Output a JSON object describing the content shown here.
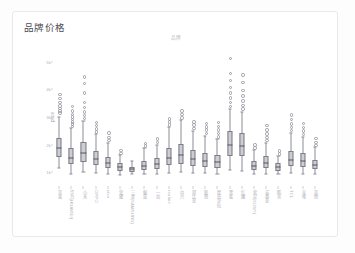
{
  "panel": {
    "title": "品牌价格"
  },
  "chart_data": {
    "type": "box",
    "title": "品牌",
    "xlabel": "",
    "ylabel": "price",
    "ylim": [
      500,
      5500
    ],
    "grid": false,
    "legend": null,
    "ytick_values": [
      5000,
      4000,
      3000,
      2000,
      1000
    ],
    "ytick_labels": [
      "5k",
      "4k",
      "3k",
      "2k",
      "1k"
    ],
    "categories": [
      "苹果",
      "华为(HUAWEI)",
      "小米",
      "OPPO",
      "vivo",
      "荣耀",
      "三星(SAMSUNG)",
      "魅族",
      "一加",
      "realme",
      "中兴",
      "努比亚",
      "联想",
      "摩托罗拉",
      "黑鲨",
      "红魔",
      "索尼(SONY)",
      "诺基亚",
      "酷派",
      "TCL",
      "朵唯",
      "其他"
    ],
    "boxes": [
      {
        "category": "苹果",
        "q1": 1550,
        "median": 1880,
        "q3": 2250,
        "whisker_low": 1150,
        "whisker_high": 3000,
        "fliers": [
          3180,
          3260,
          3340,
          3430,
          3560,
          3700,
          3860
        ]
      },
      {
        "category": "华为(HUAWEI)",
        "q1": 1280,
        "median": 1520,
        "q3": 1880,
        "whisker_low": 950,
        "whisker_high": 2600,
        "fliers": [
          2700,
          2780,
          2860,
          2940,
          3030,
          3120,
          3260,
          3420
        ]
      },
      {
        "category": "小米",
        "q1": 1380,
        "median": 1700,
        "q3": 2100,
        "whisker_low": 1000,
        "whisker_high": 2850,
        "fliers": [
          2980,
          3090,
          3210,
          3380,
          3560,
          3900,
          4250,
          4480
        ]
      },
      {
        "category": "OPPO",
        "q1": 1250,
        "median": 1480,
        "q3": 1760,
        "whisker_low": 980,
        "whisker_high": 2380,
        "fliers": [
          2500,
          2610,
          2720,
          2840
        ]
      },
      {
        "category": "vivo",
        "q1": 1150,
        "median": 1330,
        "q3": 1560,
        "whisker_low": 930,
        "whisker_high": 2050,
        "fliers": [
          2180,
          2300,
          2450
        ]
      },
      {
        "category": "荣耀",
        "q1": 1050,
        "median": 1180,
        "q3": 1330,
        "whisker_low": 900,
        "whisker_high": 1620,
        "fliers": [
          1720,
          1830
        ]
      },
      {
        "category": "三星(SAMSUNG)",
        "q1": 1020,
        "median": 1100,
        "q3": 1200,
        "whisker_low": 930,
        "whisker_high": 1400,
        "fliers": []
      },
      {
        "category": "魅族",
        "q1": 1080,
        "median": 1230,
        "q3": 1420,
        "whisker_low": 940,
        "whisker_high": 1880,
        "fliers": [
          1980,
          2080
        ]
      },
      {
        "category": "一加",
        "q1": 1120,
        "median": 1300,
        "q3": 1520,
        "whisker_low": 950,
        "whisker_high": 2000,
        "fliers": [
          2120,
          2240
        ]
      },
      {
        "category": "realme",
        "q1": 1260,
        "median": 1520,
        "q3": 1880,
        "whisker_low": 980,
        "whisker_high": 2620,
        "fliers": [
          2740,
          2850,
          2960
        ]
      },
      {
        "category": "中兴",
        "q1": 1300,
        "median": 1620,
        "q3": 2020,
        "whisker_low": 1000,
        "whisker_high": 2880,
        "fliers": [
          3000,
          3120,
          3250
        ]
      },
      {
        "category": "努比亚",
        "q1": 1240,
        "median": 1480,
        "q3": 1800,
        "whisker_low": 970,
        "whisker_high": 2500,
        "fliers": [
          2620,
          2740,
          2860
        ]
      },
      {
        "category": "联想",
        "q1": 1200,
        "median": 1420,
        "q3": 1700,
        "whisker_low": 960,
        "whisker_high": 2320,
        "fliers": [
          2440,
          2560,
          2680,
          2800
        ]
      },
      {
        "category": "摩托罗拉",
        "q1": 1160,
        "median": 1360,
        "q3": 1620,
        "whisker_low": 950,
        "whisker_high": 2200,
        "fliers": [
          2320,
          2440,
          2560,
          2700,
          2840
        ]
      },
      {
        "category": "黑鲨",
        "q1": 1600,
        "median": 2000,
        "q3": 2480,
        "whisker_low": 1080,
        "whisker_high": 3280,
        "fliers": [
          3420,
          3560,
          3720,
          3900,
          4100,
          4350,
          4620,
          5150
        ]
      },
      {
        "category": "红魔",
        "q1": 1580,
        "median": 1960,
        "q3": 2420,
        "whisker_low": 1060,
        "whisker_high": 3180,
        "fliers": [
          3320,
          3460,
          3620,
          3800,
          4000,
          4280,
          4550
        ]
      },
      {
        "category": "索尼(SONY)",
        "q1": 1080,
        "median": 1220,
        "q3": 1400,
        "whisker_low": 940,
        "whisker_high": 1820,
        "fliers": [
          1920,
          2030
        ]
      },
      {
        "category": "诺基亚",
        "q1": 1140,
        "median": 1340,
        "q3": 1580,
        "whisker_low": 950,
        "whisker_high": 2060,
        "fliers": [
          2180,
          2300,
          2420,
          2560,
          2720
        ]
      },
      {
        "category": "酷派",
        "q1": 1060,
        "median": 1180,
        "q3": 1320,
        "whisker_low": 930,
        "whisker_high": 1600,
        "fliers": [
          1700,
          1800
        ]
      },
      {
        "category": "TCL",
        "q1": 1220,
        "median": 1460,
        "q3": 1760,
        "whisker_low": 960,
        "whisker_high": 2420,
        "fliers": [
          2540,
          2660,
          2790,
          2940,
          3100
        ]
      },
      {
        "category": "朵唯",
        "q1": 1180,
        "median": 1400,
        "q3": 1680,
        "whisker_low": 950,
        "whisker_high": 2280,
        "fliers": [
          2400,
          2520,
          2650,
          2800
        ]
      },
      {
        "category": "其他",
        "q1": 1100,
        "median": 1260,
        "q3": 1460,
        "whisker_low": 940,
        "whisker_high": 1900,
        "fliers": [
          2000,
          2120,
          2260
        ]
      }
    ]
  },
  "style": {
    "box_fill": "#cdcdd4",
    "box_edge": "#7d7d87",
    "median_color": "#55555e",
    "whisker_color": "#8c8c95",
    "flier_color": "#9a9aa3",
    "text_color": "#b3b3bb",
    "card_border": "#e9e9ec"
  }
}
